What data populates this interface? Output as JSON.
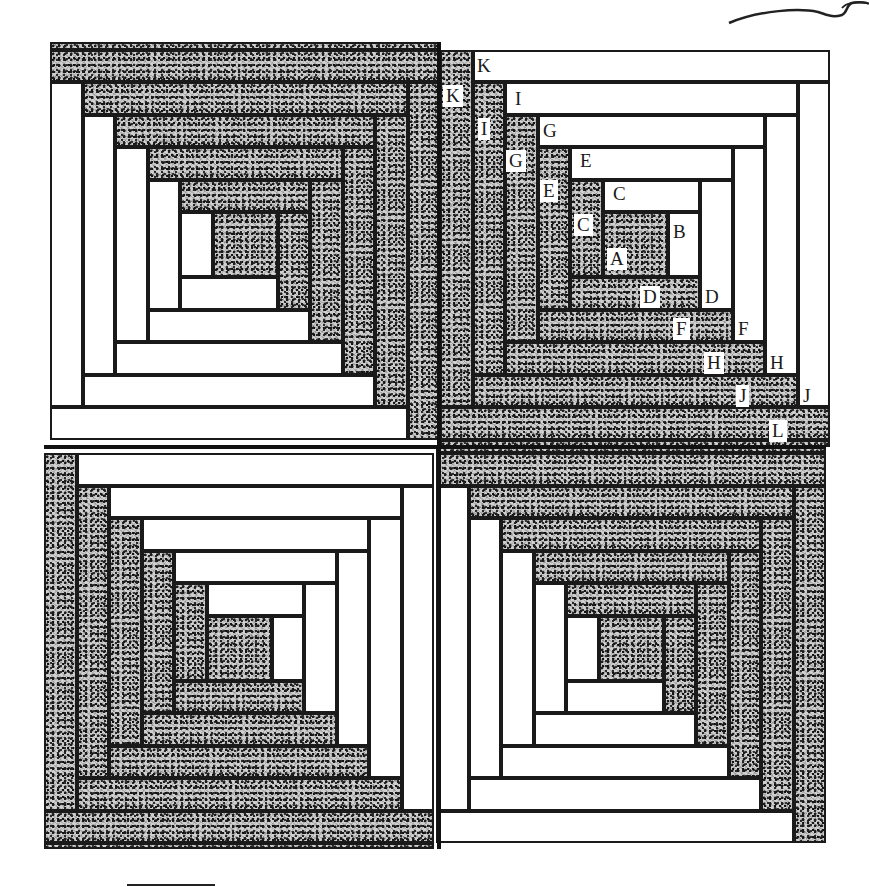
{
  "diagram": {
    "layout": {
      "quilt_left": 44,
      "quilt_top": 42,
      "quilt_right": 826,
      "quilt_bottom": 849,
      "center_x": 440,
      "center_y": 447,
      "strip_width": 32.5,
      "center_square": 65
    },
    "blocks": [
      {
        "name": "top-left-block",
        "rotation": "dark top/right, light bottom/left"
      },
      {
        "name": "top-right-block",
        "rotation": "light top/right, dark bottom/left",
        "labeled": true
      },
      {
        "name": "bottom-left-block",
        "rotation": "light top/right, dark bottom/left"
      },
      {
        "name": "bottom-right-block",
        "rotation": "dark top/right, light bottom/left"
      }
    ],
    "labels": [
      {
        "text": "A",
        "x": 607,
        "y": 248,
        "onDark": true
      },
      {
        "text": "B",
        "x": 670,
        "y": 221,
        "onDark": false
      },
      {
        "text": "C",
        "x": 610,
        "y": 183,
        "onDark": false
      },
      {
        "text": "C",
        "x": 574,
        "y": 214,
        "onDark": true
      },
      {
        "text": "D",
        "x": 640,
        "y": 286,
        "onDark": true
      },
      {
        "text": "D",
        "x": 702,
        "y": 286,
        "onDark": false
      },
      {
        "text": "E",
        "x": 577,
        "y": 150,
        "onDark": false
      },
      {
        "text": "E",
        "x": 540,
        "y": 180,
        "onDark": true
      },
      {
        "text": "F",
        "x": 673,
        "y": 318,
        "onDark": true
      },
      {
        "text": "F",
        "x": 735,
        "y": 318,
        "onDark": false
      },
      {
        "text": "G",
        "x": 540,
        "y": 120,
        "onDark": false
      },
      {
        "text": "G",
        "x": 506,
        "y": 150,
        "onDark": true
      },
      {
        "text": "H",
        "x": 704,
        "y": 352,
        "onDark": true
      },
      {
        "text": "H",
        "x": 767,
        "y": 352,
        "onDark": false
      },
      {
        "text": "I",
        "x": 512,
        "y": 88,
        "onDark": false
      },
      {
        "text": "I",
        "x": 478,
        "y": 118,
        "onDark": true
      },
      {
        "text": "J",
        "x": 736,
        "y": 385,
        "onDark": true
      },
      {
        "text": "J",
        "x": 800,
        "y": 385,
        "onDark": false
      },
      {
        "text": "K",
        "x": 474,
        "y": 55,
        "onDark": false
      },
      {
        "text": "K",
        "x": 443,
        "y": 85,
        "onDark": true
      },
      {
        "text": "L",
        "x": 769,
        "y": 420,
        "onDark": true
      }
    ],
    "decorations": {
      "thread_icon": "thread-curl-icon",
      "bottom_rule": {
        "x": 127,
        "y": 885,
        "width": 88
      }
    }
  }
}
